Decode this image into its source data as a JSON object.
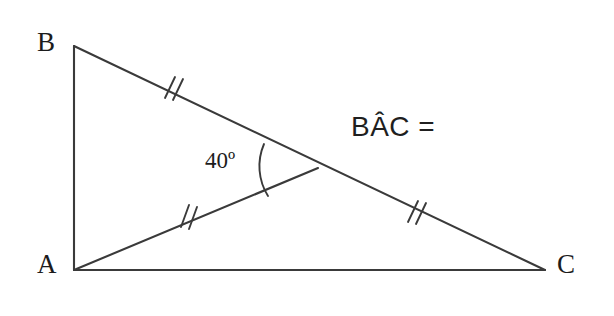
{
  "figure": {
    "type": "geometry-diagram",
    "background_color": "#ffffff",
    "stroke_color": "#3a3a3a",
    "text_color": "#1c1c1c"
  },
  "vertices": {
    "b": {
      "label": "B",
      "x": 74,
      "y": 46
    },
    "a": {
      "label": "A",
      "x": 74,
      "y": 270
    },
    "c": {
      "label": "C",
      "x": 545,
      "y": 270
    },
    "intersection": {
      "label": "",
      "x": 312,
      "y": 165
    }
  },
  "labels": {
    "vertex_b": "B",
    "vertex_a": "A",
    "vertex_c": "C",
    "angle": "40º",
    "expression": "BÂC ="
  },
  "segments": [
    {
      "name": "side-ba",
      "from": "B",
      "to": "A",
      "ticks": 0
    },
    {
      "name": "side-ac",
      "from": "A",
      "to": "C",
      "ticks": 0
    },
    {
      "name": "segment-b-intersection",
      "from": "B",
      "to": "intersection",
      "ticks": 2
    },
    {
      "name": "segment-intersection-c",
      "from": "intersection",
      "to": "C",
      "ticks": 2
    },
    {
      "name": "cevian-a-intersection",
      "from": "A",
      "to": "intersection",
      "ticks": 2
    }
  ],
  "tick_marks": [
    {
      "name": "tick-mark-bc-upper",
      "x": 172,
      "y": 88,
      "count": 2
    },
    {
      "name": "tick-mark-cevian",
      "x": 188,
      "y": 216,
      "count": 2
    },
    {
      "name": "tick-mark-bc-lower",
      "x": 415,
      "y": 211,
      "count": 2
    }
  ],
  "angle_arc": {
    "name": "angle-arc-40",
    "vertex_x": 312,
    "vertex_y": 165,
    "value": "40º",
    "opens": "left"
  }
}
